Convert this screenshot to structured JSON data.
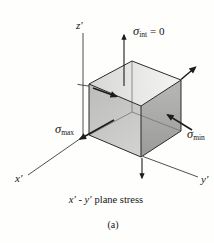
{
  "figure": {
    "caption_axes": "x′ - y′",
    "caption_text": "plane stress",
    "sublabel": "(a)"
  },
  "axes": {
    "x": "x′",
    "y": "y′",
    "z": "z′"
  },
  "stress_labels": {
    "intermediate": {
      "symbol": "σ",
      "subscript": "int",
      "suffix": "= 0"
    },
    "max": {
      "symbol": "σ",
      "subscript": "max"
    },
    "min": {
      "symbol": "σ",
      "subscript": "min"
    }
  },
  "colors": {
    "top_face": "#e7e7e5",
    "front_face": "#c8c8c6",
    "right_face": "#a8a8a6",
    "edge_line": "#2b2b29",
    "hidden_edge": "#747470",
    "arrow": "#1c1c1c",
    "background": "#fefefd"
  }
}
